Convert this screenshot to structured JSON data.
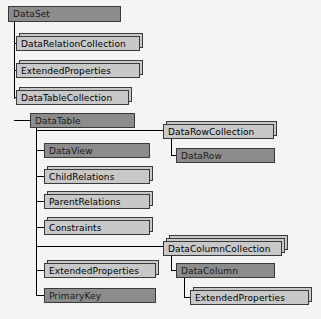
{
  "diagram": {
    "canvas": {
      "width": 321,
      "height": 319,
      "background": "#f4f4f2"
    },
    "colors": {
      "class_fill": "#8c8c8c",
      "collection_fill": "#c8c8c8",
      "border": "#3a3a3a",
      "connector": "#000000",
      "background": "#f4f4f2"
    },
    "nodes": [
      {
        "id": "dataset",
        "label": "DataSet",
        "kind": "class",
        "style": "dark",
        "stack": 1,
        "x": 8,
        "y": 6,
        "w": 113,
        "h": 16
      },
      {
        "id": "datarelationcollection",
        "label": "DataRelationCollection",
        "kind": "collection",
        "style": "light",
        "stack": 2,
        "x": 16,
        "y": 36,
        "w": 124,
        "h": 15
      },
      {
        "id": "dataset-extendedproperties",
        "label": "ExtendedProperties",
        "kind": "collection",
        "style": "light",
        "stack": 2,
        "x": 16,
        "y": 63,
        "w": 124,
        "h": 15
      },
      {
        "id": "datatablecollection",
        "label": "DataTableCollection",
        "kind": "collection",
        "style": "light",
        "stack": 2,
        "x": 16,
        "y": 90,
        "w": 113,
        "h": 15
      },
      {
        "id": "datatable",
        "label": "DataTable",
        "kind": "class",
        "style": "dark",
        "stack": 1,
        "x": 30,
        "y": 113,
        "w": 105,
        "h": 15
      },
      {
        "id": "datarowcollection",
        "label": "DataRowCollection",
        "kind": "collection",
        "style": "light",
        "stack": 2,
        "x": 163,
        "y": 124,
        "w": 111,
        "h": 15
      },
      {
        "id": "datarow",
        "label": "DataRow",
        "kind": "class",
        "style": "dark",
        "stack": 1,
        "x": 176,
        "y": 148,
        "w": 99,
        "h": 15
      },
      {
        "id": "dataview",
        "label": "DataView",
        "kind": "class",
        "style": "dark",
        "stack": 1,
        "x": 44,
        "y": 143,
        "w": 106,
        "h": 15
      },
      {
        "id": "childrelations",
        "label": "ChildRelations",
        "kind": "collection",
        "style": "light",
        "stack": 2,
        "x": 44,
        "y": 169,
        "w": 106,
        "h": 15
      },
      {
        "id": "parentrelations",
        "label": "ParentRelations",
        "kind": "collection",
        "style": "light",
        "stack": 2,
        "x": 44,
        "y": 194,
        "w": 106,
        "h": 15
      },
      {
        "id": "constraints",
        "label": "Constraints",
        "kind": "collection",
        "style": "light",
        "stack": 2,
        "x": 44,
        "y": 220,
        "w": 106,
        "h": 15
      },
      {
        "id": "datacolumncollection",
        "label": "DataColumnCollection",
        "kind": "collection",
        "style": "light",
        "stack": 3,
        "x": 163,
        "y": 241,
        "w": 119,
        "h": 15
      },
      {
        "id": "datacolumn",
        "label": "DataColumn",
        "kind": "class",
        "style": "dark",
        "stack": 1,
        "x": 176,
        "y": 263,
        "w": 99,
        "h": 15
      },
      {
        "id": "datacolumn-extendedproperties",
        "label": "ExtendedProperties",
        "kind": "collection",
        "style": "light",
        "stack": 2,
        "x": 190,
        "y": 290,
        "w": 119,
        "h": 15
      },
      {
        "id": "datatable-extendedproperties",
        "label": "ExtendedProperties",
        "kind": "collection",
        "style": "light",
        "stack": 2,
        "x": 44,
        "y": 263,
        "w": 112,
        "h": 15
      },
      {
        "id": "primarykey",
        "label": "PrimaryKey",
        "kind": "class",
        "style": "dark",
        "stack": 1,
        "x": 44,
        "y": 288,
        "w": 112,
        "h": 15
      }
    ],
    "connectors": {
      "dataset_stem": {
        "x": 14,
        "y": 22,
        "h": 77
      },
      "datatable_stem": {
        "x": 36,
        "y": 128,
        "h": 168
      },
      "datarowcol_stem": {
        "x": 171,
        "y": 139,
        "h": 17
      },
      "datacolcol_stem": {
        "x": 171,
        "y": 256,
        "h": 15
      },
      "datacolumn_stem": {
        "x": 184,
        "y": 278,
        "h": 20
      },
      "branches": [
        {
          "x": 14,
          "y": 43,
          "w": 7
        },
        {
          "x": 14,
          "y": 70,
          "w": 7
        },
        {
          "x": 14,
          "y": 97,
          "w": 7
        },
        {
          "x": 14,
          "y": 120,
          "w": 21
        },
        {
          "x": 36,
          "y": 130,
          "w": 134
        },
        {
          "x": 36,
          "y": 150,
          "w": 13
        },
        {
          "x": 36,
          "y": 176,
          "w": 13
        },
        {
          "x": 36,
          "y": 201,
          "w": 13
        },
        {
          "x": 36,
          "y": 227,
          "w": 13
        },
        {
          "x": 36,
          "y": 246,
          "w": 134
        },
        {
          "x": 36,
          "y": 270,
          "w": 13
        },
        {
          "x": 36,
          "y": 295,
          "w": 13
        },
        {
          "x": 171,
          "y": 155,
          "w": 10
        },
        {
          "x": 171,
          "y": 270,
          "w": 10
        },
        {
          "x": 184,
          "y": 297,
          "w": 11
        }
      ]
    }
  }
}
